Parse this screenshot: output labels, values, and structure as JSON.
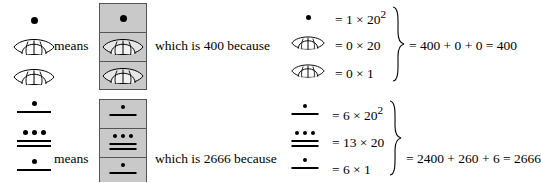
{
  "figure": {
    "type": "maya-numeral-explanation",
    "notation": "Maya vigesimal positional numerals; dot = 1, bar = 5, shell = 0",
    "colors": {
      "ink": "#000000",
      "box_fill": "#c9c9c9",
      "box_border": "#555555",
      "background": "#ffffff"
    }
  },
  "examples": [
    {
      "id": "example-400",
      "means_label": "means",
      "which_is_label": "which is 400 because",
      "left_stack": [
        {
          "glyph": "dot",
          "name": "maya-dot-1",
          "value": 1
        },
        {
          "glyph": "shell",
          "name": "maya-shell-zero",
          "value": 0
        },
        {
          "glyph": "shell",
          "name": "maya-shell-zero",
          "value": 0
        }
      ],
      "boxed_stack": [
        {
          "glyph": "dot",
          "name": "maya-dot-1",
          "value": 1
        },
        {
          "glyph": "shell",
          "name": "maya-shell-zero",
          "value": 0
        },
        {
          "glyph": "shell",
          "name": "maya-shell-zero",
          "value": 0
        }
      ],
      "equations": [
        {
          "glyph": "dot",
          "digit": 1,
          "place": "20^2",
          "text": "= 1 × 20",
          "exponent": "2"
        },
        {
          "glyph": "shell",
          "digit": 0,
          "place": "20",
          "text": "= 0 × 20",
          "exponent": ""
        },
        {
          "glyph": "shell",
          "digit": 0,
          "place": "1",
          "text": "= 0 × 1",
          "exponent": ""
        }
      ],
      "result": "= 400 + 0 + 0 = 400",
      "total": 400
    },
    {
      "id": "example-2666",
      "means_label": "means",
      "which_is_label": "which is 2666 because",
      "left_stack": [
        {
          "glyph": "numeral",
          "name": "maya-numeral-6",
          "dots": 1,
          "bars": 1,
          "value": 6
        },
        {
          "glyph": "numeral",
          "name": "maya-numeral-13",
          "dots": 3,
          "bars": 2,
          "value": 13
        },
        {
          "glyph": "numeral",
          "name": "maya-numeral-6",
          "dots": 1,
          "bars": 1,
          "value": 6
        }
      ],
      "boxed_stack": [
        {
          "glyph": "numeral",
          "name": "maya-numeral-6",
          "dots": 1,
          "bars": 1,
          "value": 6
        },
        {
          "glyph": "numeral",
          "name": "maya-numeral-13",
          "dots": 3,
          "bars": 2,
          "value": 13
        },
        {
          "glyph": "numeral",
          "name": "maya-numeral-6",
          "dots": 1,
          "bars": 1,
          "value": 6
        }
      ],
      "equations": [
        {
          "glyph": "numeral",
          "dots": 1,
          "bars": 1,
          "digit": 6,
          "place": "20^2",
          "text": "= 6 × 20",
          "exponent": "2"
        },
        {
          "glyph": "numeral",
          "dots": 3,
          "bars": 2,
          "digit": 13,
          "place": "20",
          "text": "= 13 × 20",
          "exponent": ""
        },
        {
          "glyph": "numeral",
          "dots": 1,
          "bars": 1,
          "digit": 6,
          "place": "1",
          "text": "= 6 × 1",
          "exponent": ""
        }
      ],
      "result": "= 2400 + 260 + 6 = 2666",
      "total": 2666
    }
  ]
}
